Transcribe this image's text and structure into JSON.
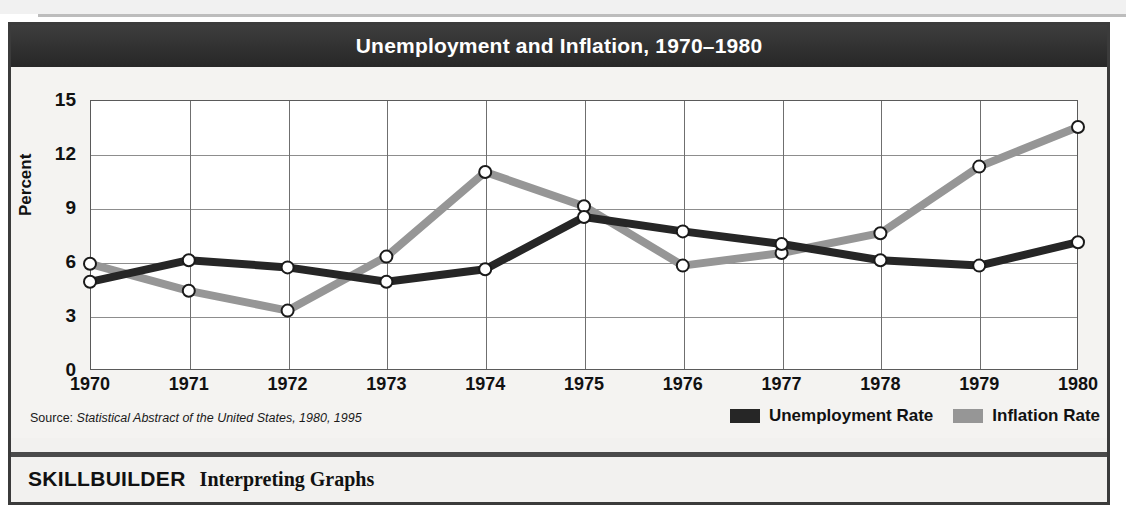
{
  "figure": {
    "title": "Unemployment and Inflation, 1970–1980",
    "source_prefix": "Source: ",
    "source_italic": "Statistical Abstract of the United States, 1980, 1995",
    "skillbuilder_label": "SKILLBUILDER",
    "skillbuilder_task": "Interpreting Graphs"
  },
  "legend": {
    "items": [
      {
        "label": "Unemployment Rate",
        "color": "#262626"
      },
      {
        "label": "Inflation Rate",
        "color": "#969696"
      }
    ]
  },
  "chart_data": {
    "type": "line",
    "title": "Unemployment and Inflation, 1970–1980",
    "xlabel": "",
    "ylabel": "Percent",
    "ylim": [
      0,
      15
    ],
    "yticks": [
      0,
      3,
      6,
      9,
      12,
      15
    ],
    "grid": true,
    "legend_position": "bottom-right",
    "categories": [
      "1970",
      "1971",
      "1972",
      "1973",
      "1974",
      "1975",
      "1976",
      "1977",
      "1978",
      "1979",
      "1980"
    ],
    "x": [
      1970,
      1971,
      1972,
      1973,
      1974,
      1975,
      1976,
      1977,
      1978,
      1979,
      1980
    ],
    "series": [
      {
        "name": "Unemployment Rate",
        "color": "#262626",
        "values": [
          4.9,
          6.1,
          5.7,
          4.9,
          5.6,
          8.5,
          7.7,
          7.0,
          6.1,
          5.8,
          7.1
        ]
      },
      {
        "name": "Inflation Rate",
        "color": "#969696",
        "values": [
          5.9,
          4.4,
          3.3,
          6.3,
          11.0,
          9.1,
          5.8,
          6.5,
          7.6,
          11.3,
          13.5
        ]
      }
    ]
  }
}
